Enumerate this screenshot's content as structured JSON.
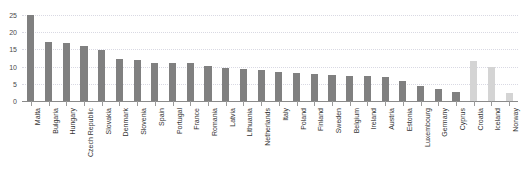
{
  "chart_data": {
    "type": "bar",
    "title": "",
    "xlabel": "",
    "ylabel": "",
    "ylim": [
      0,
      27
    ],
    "yticks": [
      0,
      5,
      10,
      15,
      20,
      25
    ],
    "grid": true,
    "legend": "none",
    "categories": [
      "Malta",
      "Bulgaria",
      "Hungary",
      "Czech Republic",
      "Slovakia",
      "Denmark",
      "Slovenia",
      "Spain",
      "Portugal",
      "France",
      "Romania",
      "Latvia",
      "Lithuania",
      "Netherlands",
      "Italy",
      "Poland",
      "Finland",
      "Sweden",
      "Belgium",
      "Ireland",
      "Austria",
      "Estonia",
      "Luxembourg",
      "Germany",
      "Cyprus",
      "Croatia",
      "Iceland",
      "Norway"
    ],
    "values": [
      24.9,
      17.0,
      16.7,
      16.0,
      14.8,
      12.2,
      11.9,
      11.1,
      11.0,
      11.0,
      10.2,
      9.7,
      9.2,
      9.1,
      8.3,
      8.0,
      7.8,
      7.5,
      7.3,
      7.2,
      7.0,
      5.8,
      4.3,
      3.6,
      2.5,
      11.5,
      9.8,
      2.2
    ],
    "series_group": [
      "primary",
      "primary",
      "primary",
      "primary",
      "primary",
      "primary",
      "primary",
      "primary",
      "primary",
      "primary",
      "primary",
      "primary",
      "primary",
      "primary",
      "primary",
      "primary",
      "primary",
      "primary",
      "primary",
      "primary",
      "primary",
      "primary",
      "primary",
      "primary",
      "primary",
      "secondary",
      "secondary",
      "secondary"
    ]
  },
  "colors": {
    "bar_primary": "#808080",
    "bar_secondary": "#d4d4d4",
    "gridline": "#d9d9e3",
    "axis": "#8a8a8a",
    "tick_label": "#4b4b4b",
    "category_label": "#333333",
    "background": "#ffffff"
  }
}
